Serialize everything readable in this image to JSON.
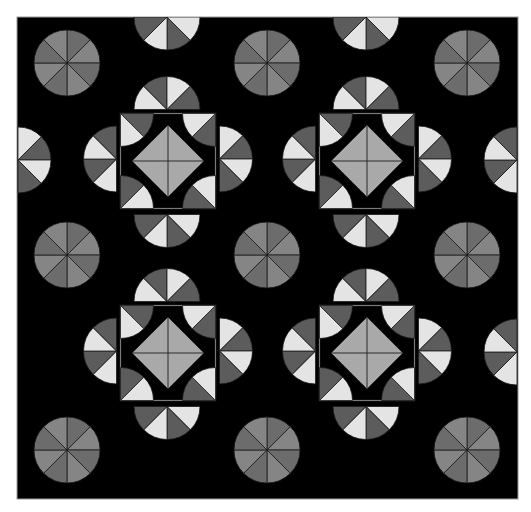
{
  "pattern": {
    "background": "#000000",
    "page_color": "#ffffff",
    "frame": {
      "x": 17,
      "y": 17,
      "w": 501,
      "h": 482
    },
    "colors": {
      "light": "#e4e4e4",
      "dark": "#5c5c5c",
      "diamond": "#a9a9a9",
      "circle_a": "#6c6c6c",
      "circle_b": "#858585",
      "line": "#1a1a1a"
    },
    "radius": 33,
    "circles": [
      {
        "cx": 67,
        "cy": 63
      },
      {
        "cx": 267,
        "cy": 63
      },
      {
        "cx": 467,
        "cy": 63
      },
      {
        "cx": 67,
        "cy": 255
      },
      {
        "cx": 267,
        "cy": 255
      },
      {
        "cx": 467,
        "cy": 255
      },
      {
        "cx": 67,
        "cy": 450
      },
      {
        "cx": 267,
        "cy": 450
      },
      {
        "cx": 467,
        "cy": 450
      }
    ],
    "motifs": [
      {
        "cx": 168,
        "cy": 161
      },
      {
        "cx": 367,
        "cy": 161
      },
      {
        "cx": 168,
        "cy": 353
      },
      {
        "cx": 367,
        "cy": 353
      }
    ],
    "edge_half_circles": [
      {
        "cx": 167,
        "cy": 17,
        "dir": "down"
      },
      {
        "cx": 366,
        "cy": 17,
        "dir": "down"
      },
      {
        "cx": 18,
        "cy": 160,
        "dir": "right"
      },
      {
        "cx": 517,
        "cy": 160,
        "dir": "left"
      },
      {
        "cx": 517,
        "cy": 352,
        "dir": "left"
      }
    ]
  }
}
